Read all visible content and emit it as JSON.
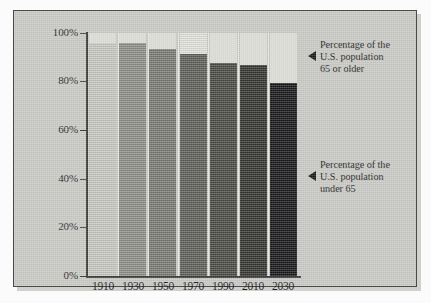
{
  "chart_data": {
    "type": "bar",
    "subtype": "stacked-percentage",
    "title": "",
    "subtitle": "",
    "xlabel": "",
    "ylabel": "",
    "categories": [
      "1910",
      "1930",
      "1950",
      "1970",
      "1990",
      "2010",
      "2030"
    ],
    "ylim": [
      0,
      100
    ],
    "yticks": [
      0,
      20,
      40,
      60,
      80,
      100
    ],
    "ytick_labels": [
      "0%",
      "20%",
      "40%",
      "60%",
      "80%",
      "100%"
    ],
    "grid": false,
    "legend_position": "right-annotations",
    "series": [
      {
        "name": "Percentage of the U.S. population under 65",
        "values": [
          95.9,
          95.9,
          93.4,
          91.3,
          87.7,
          86.8,
          79.4
        ],
        "colors": [
          "#c8c8c2",
          "#8e8e88",
          "#7a7a74",
          "#5e5e59",
          "#494944",
          "#33332f",
          "#17171a"
        ]
      },
      {
        "name": "Percentage of the U.S. population 65 or older",
        "values": [
          4.1,
          4.1,
          6.6,
          8.7,
          12.3,
          13.2,
          20.6
        ],
        "color": "#e2e2dd"
      }
    ],
    "annotations": [
      {
        "id": "annotation-over-65",
        "lines": [
          "Percentage of the",
          "U.S. population",
          "65 or older"
        ],
        "marker": "left-triangle",
        "target_series": "Percentage of the U.S. population 65 or older"
      },
      {
        "id": "annotation-under-65",
        "lines": [
          "Percentage of the",
          "U.S. population",
          "under 65"
        ],
        "marker": "left-triangle",
        "target_series": "Percentage of the U.S. population under 65"
      }
    ]
  },
  "axis": {
    "y_labels": [
      "100%",
      "80%",
      "60%",
      "40%",
      "20%",
      "0%"
    ],
    "x_labels": [
      "1910",
      "1930",
      "1950",
      "1970",
      "1990",
      "2010",
      "2030"
    ]
  },
  "annotations": {
    "over65": {
      "line1": "Percentage of the",
      "line2": "U.S. population",
      "line3": "65 or older"
    },
    "under65": {
      "line1": "Percentage of the",
      "line2": "U.S. population",
      "line3": "under 65"
    }
  },
  "colors": {
    "panel_background": "#c9c9c5",
    "frame_border": "#4a4a48",
    "axis": "#3a3a38",
    "over65_segment": "#e2e2dd",
    "page_background": "#ffffff"
  }
}
